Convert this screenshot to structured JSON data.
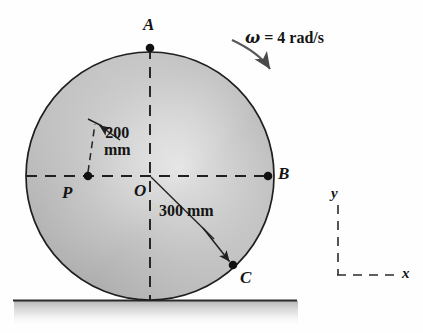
{
  "figure": {
    "colors": {
      "outline": "#1a1a1a",
      "disc_light": "#e8e8e8",
      "disc_mid": "#b9b9b9",
      "disc_dark": "#9a9a9a",
      "ground_line": "#2b2b2b",
      "ground_shadow": "#cfcfcf",
      "text": "#141414",
      "leader": "#2b2b2b"
    }
  },
  "points": {
    "a": {
      "label": "A",
      "x": 150,
      "y": 48
    },
    "b": {
      "label": "B",
      "x": 268,
      "y": 176
    },
    "c": {
      "label": "C",
      "x": 233,
      "y": 265
    },
    "o": {
      "label": "O",
      "x": 150,
      "y": 176
    },
    "p": {
      "label": "P",
      "x": 88,
      "y": 176
    }
  },
  "dimensions": {
    "radius_op": {
      "value": "200",
      "unit": "mm",
      "line1": "200",
      "line2": "mm"
    },
    "radius_oc": {
      "value": "300",
      "unit": "mm",
      "text": "300 mm"
    }
  },
  "rotation": {
    "symbol": "ω",
    "equals": "=",
    "value": "4",
    "unit": "rad/s",
    "text": "ω = 4 rad/s",
    "direction": "clockwise"
  },
  "axes": {
    "y_label": "y",
    "x_label": "x"
  }
}
